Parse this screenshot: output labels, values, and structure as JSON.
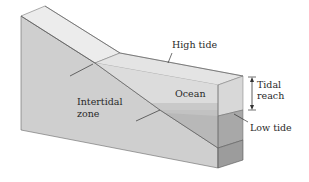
{
  "diagram": {
    "labels": {
      "high_tide": "High tide",
      "tidal_reach_line1": "Tidal",
      "tidal_reach_line2": "reach",
      "ocean": "Ocean",
      "intertidal_line1": "Intertidal",
      "intertidal_line2": "zone",
      "low_tide": "Low tide"
    },
    "colors": {
      "background": "#ffffff",
      "land_front_face": "#cfcfcf",
      "land_top_surface": "#ececec",
      "land_right_face": "#a9a9a9",
      "water_high": "#e6e6e6",
      "water_low": "#b9b9b9",
      "water_right_face_upper": "#dedede",
      "water_right_face_lower": "#b0b0b0",
      "outline": "#555555",
      "leader_line": "#333333"
    }
  }
}
